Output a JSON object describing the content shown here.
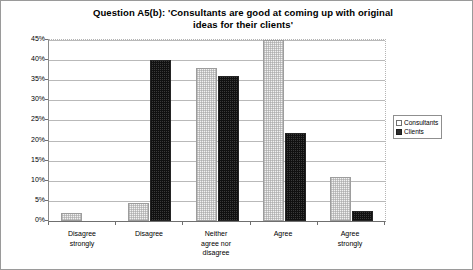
{
  "chart_data": {
    "type": "bar",
    "title": "Question A5(b): 'Consultants are good at coming up with original ideas for their clients'",
    "title_line1": "Question A5(b): 'Consultants are good at coming up with original",
    "title_line2": "ideas for their clients'",
    "xlabel": "",
    "ylabel": "",
    "ylim": [
      0,
      45
    ],
    "ytick_labels": [
      "45%",
      "40%",
      "35%",
      "30%",
      "25%",
      "20%",
      "15%",
      "10%",
      "5%",
      "0%"
    ],
    "ytick_values": [
      45,
      40,
      35,
      30,
      25,
      20,
      15,
      10,
      5,
      0
    ],
    "grid": true,
    "legend_position": "right",
    "categories": [
      "Disagree strongly",
      "Disagree",
      "Neither agree nor disagree",
      "Agree",
      "Agree strongly"
    ],
    "category_lines": [
      [
        "Disagree",
        "strongly"
      ],
      [
        "Disagree"
      ],
      [
        "Neither",
        "agree nor",
        "disagree"
      ],
      [
        "Agree"
      ],
      [
        "Agree",
        "strongly"
      ]
    ],
    "series": [
      {
        "name": "Consultants",
        "color": "#f2f2f2",
        "values": [
          2,
          4.5,
          38,
          45,
          11
        ]
      },
      {
        "name": "Clients",
        "color": "#3a3a3a",
        "values": [
          0,
          40,
          36,
          22,
          2.5
        ]
      }
    ]
  },
  "legend": {
    "items": [
      {
        "label": "Consultants"
      },
      {
        "label": "Clients"
      }
    ]
  }
}
